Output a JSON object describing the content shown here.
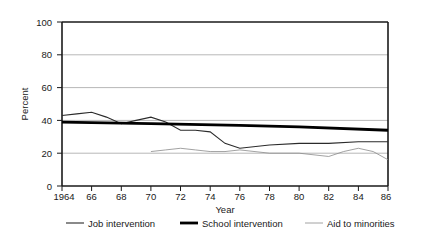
{
  "chart_data": {
    "type": "line",
    "title": "",
    "xlabel": "Year",
    "ylabel": "Percent",
    "ylim": [
      0,
      100
    ],
    "xlim": [
      1964,
      1986
    ],
    "yticks": [
      0,
      20,
      40,
      60,
      80,
      100
    ],
    "ytick_labels": [
      "0",
      "20",
      "40",
      "60",
      "80",
      "100"
    ],
    "xticks": [
      1964,
      1966,
      1968,
      1970,
      1972,
      1974,
      1976,
      1978,
      1980,
      1982,
      1984,
      1986
    ],
    "xtick_labels": [
      "1964",
      "66",
      "68",
      "70",
      "72",
      "74",
      "76",
      "78",
      "80",
      "82",
      "84",
      "86"
    ],
    "grid": "horizontal",
    "legend_position": "bottom",
    "series": [
      {
        "name": "Job intervention",
        "style": "medium",
        "color": "#2b2b2b",
        "x": [
          1964,
          1965,
          1966,
          1967,
          1968,
          1969,
          1970,
          1971,
          1972,
          1973,
          1974,
          1975,
          1976,
          1978,
          1980,
          1982,
          1984,
          1986
        ],
        "values": [
          43,
          44,
          45,
          42,
          38,
          40,
          42,
          39,
          34,
          34,
          33,
          26,
          23,
          25,
          26,
          26,
          27,
          27
        ]
      },
      {
        "name": "School intervention",
        "style": "thick",
        "color": "#000000",
        "x": [
          1964,
          1970,
          1976,
          1980,
          1986
        ],
        "values": [
          39,
          38,
          37,
          36,
          34
        ]
      },
      {
        "name": "Aid to minorities",
        "style": "thin",
        "color": "#8a8a8a",
        "x": [
          1970,
          1971,
          1972,
          1973,
          1974,
          1975,
          1976,
          1978,
          1980,
          1982,
          1983,
          1984,
          1985,
          1986
        ],
        "values": [
          21,
          22,
          23,
          22,
          21,
          21,
          22,
          20,
          20,
          18,
          21,
          23,
          21,
          16
        ]
      }
    ]
  },
  "axes": {
    "ylabel": "Percent",
    "xlabel": "Year",
    "ytick_0": "0",
    "ytick_20": "20",
    "ytick_40": "40",
    "ytick_60": "60",
    "ytick_80": "80",
    "ytick_100": "100",
    "xtick_1964": "1964",
    "xtick_66": "66",
    "xtick_68": "68",
    "xtick_70": "70",
    "xtick_72": "72",
    "xtick_74": "74",
    "xtick_76": "76",
    "xtick_78": "78",
    "xtick_80": "80",
    "xtick_82": "82",
    "xtick_84": "84",
    "xtick_86": "86"
  },
  "legend": {
    "item1": "Job intervention",
    "item2": "School intervention",
    "item3": "Aid to minorities"
  },
  "colors": {
    "frame": "#1a1a1a",
    "grid": "#9a9a9a",
    "series_job": "#2b2b2b",
    "series_school": "#000000",
    "series_aid": "#8a8a8a",
    "background": "#ffffff"
  }
}
